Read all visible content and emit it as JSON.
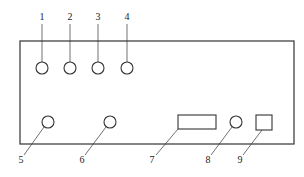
{
  "diagram": {
    "type": "front-panel-schematic",
    "panel": {
      "x": 20,
      "y": 41,
      "width": 274,
      "height": 103
    },
    "components": [
      {
        "id": "1",
        "label": "1",
        "shape": "circle",
        "cx": 42,
        "cy": 68,
        "r": 6,
        "label_x": 42,
        "label_y": 20,
        "leader": [
          42,
          24,
          42,
          62
        ]
      },
      {
        "id": "2",
        "label": "2",
        "shape": "circle",
        "cx": 70,
        "cy": 68,
        "r": 6,
        "label_x": 70,
        "label_y": 20,
        "leader": [
          70,
          24,
          70,
          62
        ]
      },
      {
        "id": "3",
        "label": "3",
        "shape": "circle",
        "cx": 98,
        "cy": 68,
        "r": 6,
        "label_x": 98,
        "label_y": 20,
        "leader": [
          98,
          24,
          98,
          62
        ]
      },
      {
        "id": "4",
        "label": "4",
        "shape": "circle",
        "cx": 127,
        "cy": 68,
        "r": 6,
        "label_x": 127,
        "label_y": 20,
        "leader": [
          127,
          24,
          127,
          62
        ]
      },
      {
        "id": "5",
        "label": "5",
        "shape": "circle",
        "cx": 48,
        "cy": 122,
        "r": 6,
        "label_x": 21,
        "label_y": 163,
        "leader": [
          44,
          127,
          24,
          155
        ]
      },
      {
        "id": "6",
        "label": "6",
        "shape": "circle",
        "cx": 110,
        "cy": 122,
        "r": 6,
        "label_x": 82,
        "label_y": 163,
        "leader": [
          106,
          127,
          85,
          155
        ]
      },
      {
        "id": "7",
        "label": "7",
        "shape": "rect",
        "x": 178,
        "y": 115,
        "w": 38,
        "h": 14,
        "label_x": 152,
        "label_y": 163,
        "leader": [
          178,
          129,
          156,
          155
        ]
      },
      {
        "id": "8",
        "label": "8",
        "shape": "circle",
        "cx": 236,
        "cy": 122,
        "r": 6,
        "label_x": 208,
        "label_y": 163,
        "leader": [
          232,
          127,
          211,
          155
        ]
      },
      {
        "id": "9",
        "label": "9",
        "shape": "rect",
        "x": 256,
        "y": 115,
        "w": 16,
        "h": 15,
        "label_x": 240,
        "label_y": 163,
        "leader": [
          262,
          130,
          243,
          155
        ]
      }
    ],
    "colors": {
      "line": "#333333",
      "background": "#ffffff"
    }
  }
}
